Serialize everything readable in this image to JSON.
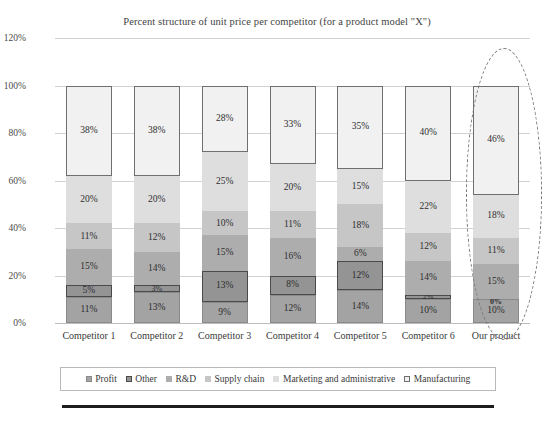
{
  "chart_data": {
    "type": "bar",
    "stacked": true,
    "stack_mode": "percent",
    "title": "Percent structure of unit price per competitor (for a product model \"X\")",
    "xlabel": "",
    "ylabel": "",
    "ylim": [
      0,
      120
    ],
    "ytick_labels": [
      "0%",
      "20%",
      "40%",
      "60%",
      "80%",
      "100%",
      "120%"
    ],
    "ytick_values": [
      0,
      20,
      40,
      60,
      80,
      100,
      120
    ],
    "grid": true,
    "legend_position": "bottom",
    "categories": [
      "Competitor 1",
      "Competitor 2",
      "Competitor 3",
      "Competitor 4",
      "Competitor 5",
      "Competitor 6",
      "Our product"
    ],
    "series": [
      {
        "name": "Profit",
        "color": "#a3a3a3",
        "border": "#8a8a8a",
        "values": [
          11,
          13,
          9,
          12,
          14,
          10,
          10
        ],
        "labels": [
          "11%",
          "13%",
          "9%",
          "12%",
          "14%",
          "10%",
          "10%"
        ]
      },
      {
        "name": "Other",
        "color": "#949494",
        "border": "#4a4a4a",
        "values": [
          5,
          3,
          13,
          8,
          12,
          2,
          0
        ],
        "labels": [
          "5%",
          "3%",
          "13%",
          "8%",
          "12%",
          "2%",
          "0%"
        ]
      },
      {
        "name": "R&D",
        "color": "#adadad",
        "border": "#adadad",
        "values": [
          15,
          14,
          15,
          16,
          6,
          14,
          15
        ],
        "labels": [
          "15%",
          "14%",
          "15%",
          "16%",
          "6%",
          "14%",
          "15%"
        ]
      },
      {
        "name": "Supply chain",
        "color": "#c6c6c6",
        "border": "#c6c6c6",
        "values": [
          11,
          12,
          10,
          11,
          18,
          12,
          11
        ],
        "labels": [
          "11%",
          "12%",
          "10%",
          "11%",
          "18%",
          "12%",
          "11%"
        ]
      },
      {
        "name": "Marketing and administrative",
        "color": "#dedede",
        "border": "#dedede",
        "values": [
          20,
          20,
          25,
          20,
          15,
          22,
          18
        ],
        "labels": [
          "20%",
          "20%",
          "25%",
          "20%",
          "15%",
          "22%",
          "18%"
        ]
      },
      {
        "name": "Manufacturing",
        "color": "#f1f1f1",
        "border": "#6f6f6f",
        "values": [
          38,
          38,
          28,
          33,
          35,
          40,
          46
        ],
        "labels": [
          "38%",
          "38%",
          "28%",
          "33%",
          "35%",
          "40%",
          "46%"
        ]
      }
    ],
    "annotations": [
      {
        "type": "ellipse",
        "style": "dashed",
        "color": "#777777",
        "target": "Our product"
      }
    ]
  }
}
